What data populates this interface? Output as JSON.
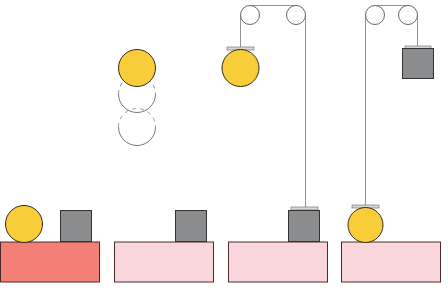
{
  "diagram": {
    "colors": {
      "table_active": "#f47f76",
      "table_inactive": "#f9d6dc",
      "ball": "#f7ce3a",
      "box": "#8a8c8e",
      "outline": "#3a2a2a",
      "rope": "#777777",
      "plate": "#d8d8d8"
    },
    "panels": [
      {
        "id": 1,
        "label": "ball-and-box-on-table",
        "table_color": "table_active"
      },
      {
        "id": 2,
        "label": "ball-falling",
        "table_color": "table_inactive"
      },
      {
        "id": 3,
        "label": "pulley-ball-raised",
        "table_color": "table_inactive"
      },
      {
        "id": 4,
        "label": "pulley-box-raised",
        "table_color": "table_inactive"
      }
    ]
  }
}
